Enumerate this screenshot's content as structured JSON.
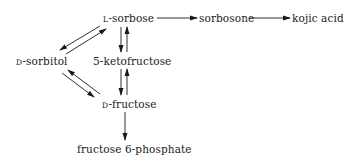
{
  "diagram": {
    "type": "metabolic-pathway",
    "nodes": [
      {
        "id": "l-sorbose",
        "prefix": "L",
        "name": "-sorbose"
      },
      {
        "id": "sorbosone",
        "prefix": "",
        "name": "sorbosone"
      },
      {
        "id": "kojic-acid",
        "prefix": "",
        "name": "kojic acid"
      },
      {
        "id": "d-sorbitol",
        "prefix": "D",
        "name": "-sorbitol"
      },
      {
        "id": "5-ketofructose",
        "prefix": "",
        "name": "5-ketofructose"
      },
      {
        "id": "d-fructose",
        "prefix": "D",
        "name": "-fructose"
      },
      {
        "id": "fructose-6-phosphate",
        "prefix": "",
        "name": "fructose 6-phosphate"
      }
    ],
    "edges": [
      {
        "from": "l-sorbose",
        "to": "sorbosone",
        "type": "irreversible"
      },
      {
        "from": "sorbosone",
        "to": "kojic-acid",
        "type": "irreversible"
      },
      {
        "from": "l-sorbose",
        "to": "d-sorbitol",
        "type": "reversible"
      },
      {
        "from": "l-sorbose",
        "to": "5-ketofructose",
        "type": "reversible"
      },
      {
        "from": "d-sorbitol",
        "to": "d-fructose",
        "type": "reversible"
      },
      {
        "from": "5-ketofructose",
        "to": "d-fructose",
        "type": "reversible"
      },
      {
        "from": "d-fructose",
        "to": "fructose-6-phosphate",
        "type": "irreversible"
      }
    ],
    "colors": {
      "line": "#1a1a1a",
      "background": "#ffffff"
    }
  }
}
